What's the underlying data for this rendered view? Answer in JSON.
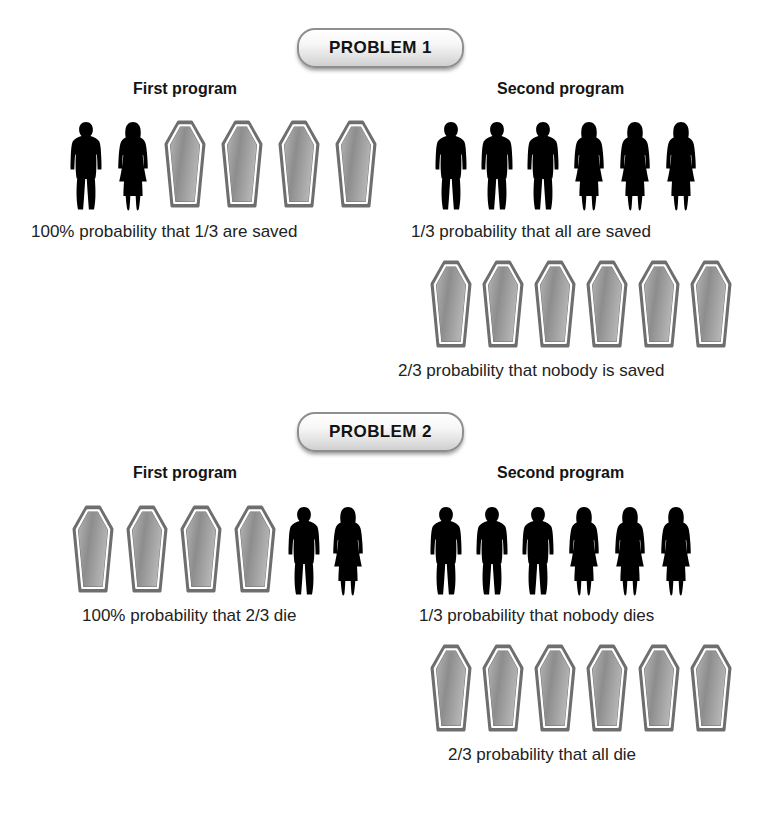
{
  "problems": [
    {
      "badge_label": "PROBLEM 1",
      "columns": [
        {
          "heading": "First program",
          "rows": [
            {
              "icons": [
                "person-male-icon",
                "person-female-icon",
                "coffin-icon",
                "coffin-icon",
                "coffin-icon",
                "coffin-icon"
              ],
              "caption": "100% probability that 1/3 are saved"
            }
          ]
        },
        {
          "heading": "Second program",
          "rows": [
            {
              "icons": [
                "person-male-icon",
                "person-male-icon",
                "person-male-icon",
                "person-female-icon",
                "person-female-icon",
                "person-female-icon"
              ],
              "caption": "1/3 probability that all are saved"
            },
            {
              "icons": [
                "coffin-icon",
                "coffin-icon",
                "coffin-icon",
                "coffin-icon",
                "coffin-icon",
                "coffin-icon"
              ],
              "caption": "2/3 probability that nobody is saved"
            }
          ]
        }
      ]
    },
    {
      "badge_label": "PROBLEM 2",
      "columns": [
        {
          "heading": "First program",
          "rows": [
            {
              "icons": [
                "coffin-icon",
                "coffin-icon",
                "coffin-icon",
                "coffin-icon",
                "person-male-icon",
                "person-female-icon"
              ],
              "caption": "100% probability that 2/3 die"
            }
          ]
        },
        {
          "heading": "Second program",
          "rows": [
            {
              "icons": [
                "person-male-icon",
                "person-male-icon",
                "person-male-icon",
                "person-female-icon",
                "person-female-icon",
                "person-female-icon"
              ],
              "caption": "1/3 probability that nobody dies"
            },
            {
              "icons": [
                "coffin-icon",
                "coffin-icon",
                "coffin-icon",
                "coffin-icon",
                "coffin-icon",
                "coffin-icon"
              ],
              "caption": "2/3 probability that all die"
            }
          ]
        }
      ]
    }
  ],
  "colors": {
    "silhouette": "#000000",
    "coffin_border": "#6e6e6e",
    "coffin_inner_line": "#ffffff",
    "coffin_fill_light": "#b4b4b4",
    "coffin_fill_dark": "#8d8d8d",
    "badge_border": "#8f8f8f",
    "text": "#1a1a1a",
    "background": "#ffffff"
  },
  "layout": {
    "badge1_top": 28,
    "badge2_top": 412,
    "p1_headings_top": 80,
    "p2_headings_top": 464,
    "p1_first_heading_left": 133,
    "p1_second_heading_left": 497,
    "p2_first_heading_left": 133,
    "p2_second_heading_left": 497,
    "p1_row1_left": 68,
    "p1_row1_top": 120,
    "p1_cap1_left": 31,
    "p1_cap1_top": 222,
    "p1_row2_left": 433,
    "p1_row2_top": 120,
    "p1_cap2_left": 411,
    "p1_cap2_top": 222,
    "p1_row3_left": 428,
    "p1_row3_top": 260,
    "p1_cap3_left": 398,
    "p1_cap3_top": 361,
    "p2_row1_left": 70,
    "p2_row1_top": 505,
    "p2_cap1_left": 82,
    "p2_cap1_top": 606,
    "p2_row2_left": 428,
    "p2_row2_top": 505,
    "p2_cap2_left": 419,
    "p2_cap2_top": 606,
    "p2_row3_left": 428,
    "p2_row3_top": 644,
    "p2_cap3_left": 448,
    "p2_cap3_top": 745
  }
}
